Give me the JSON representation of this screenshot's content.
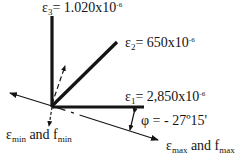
{
  "diagram": {
    "type": "strain-rosette",
    "gauges": [
      {
        "id": "e1",
        "symbol": "ε",
        "subscript": "1",
        "equals": "=",
        "value": "2,850x10",
        "exponent": "-6",
        "direction_deg": 0
      },
      {
        "id": "e2",
        "symbol": "ε",
        "subscript": "2",
        "equals": "=",
        "value": "650x10",
        "exponent": "-6",
        "direction_deg": 45
      },
      {
        "id": "e3",
        "symbol": "ε",
        "subscript": "3",
        "equals": "=",
        "value": "1.020x10",
        "exponent": "-6",
        "direction_deg": 90
      }
    ],
    "angle": {
      "symbol": "φ",
      "text": "= - 27º15'"
    },
    "principal_axes": {
      "max": {
        "eps": "ε",
        "eps_sub": "max",
        "and": " and f",
        "f_sub": "max"
      },
      "min": {
        "eps": "ε",
        "eps_sub": "min",
        "and": " and f",
        "f_sub": "min"
      }
    },
    "colors": {
      "line": "#141414",
      "background": "#ffffff"
    }
  }
}
